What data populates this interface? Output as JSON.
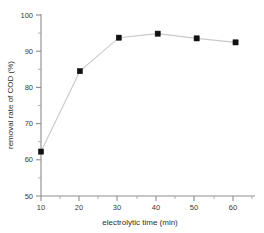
{
  "chart_data": {
    "type": "line",
    "title": "",
    "xlabel": "electrolytic time (min)",
    "ylabel": "removal rate of COD (%)",
    "xlim": [
      10,
      65
    ],
    "ylim": [
      50,
      100
    ],
    "xticks": [
      10,
      20,
      30,
      40,
      50,
      60
    ],
    "xtick_labels": [
      "10",
      "20",
      "30",
      "40",
      "50",
      "60"
    ],
    "xminor_ticks": [
      15,
      25,
      35,
      45,
      55,
      65
    ],
    "yticks": [
      50,
      60,
      70,
      80,
      90,
      100
    ],
    "ytick_labels": [
      "50",
      "60",
      "70",
      "80",
      "90",
      "100"
    ],
    "yminor_ticks": [
      55,
      65,
      75,
      85,
      95
    ],
    "grid": false,
    "legend": null,
    "marker": "filled-square",
    "line_color": "#c9c9c9",
    "marker_color": "#111111",
    "x": [
      10,
      20,
      30,
      40,
      50,
      60
    ],
    "values": [
      62.2,
      84.3,
      93.5,
      94.6,
      93.3,
      92.2
    ],
    "series": [
      {
        "name": "removal rate of COD",
        "x": [
          10,
          20,
          30,
          40,
          50,
          60
        ],
        "values": [
          62.2,
          84.3,
          93.5,
          94.6,
          93.3,
          92.2
        ]
      }
    ]
  },
  "axes": {
    "x_title": "electrolytic time (min)",
    "y_title": "removal rate of COD (%)",
    "x_tick_0": "10",
    "x_tick_1": "20",
    "x_tick_2": "30",
    "x_tick_3": "40",
    "x_tick_4": "50",
    "x_tick_5": "60",
    "y_tick_0": "50",
    "y_tick_1": "60",
    "y_tick_2": "70",
    "y_tick_3": "80",
    "y_tick_4": "90",
    "y_tick_5": "100"
  }
}
